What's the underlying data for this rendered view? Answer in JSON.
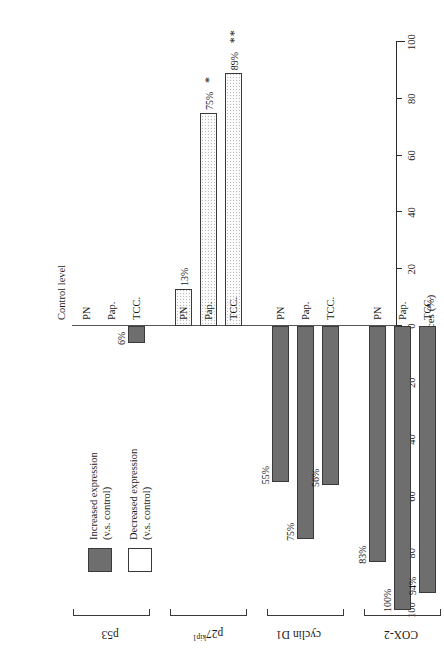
{
  "chart_data": {
    "type": "bar",
    "orientation": "horizontal-diverging",
    "title": "",
    "xlabel": "Incidences (%)",
    "ylabel": "",
    "axis_title": "Incidences (%)",
    "control_line_label": "Control level",
    "xlim": [
      -100,
      100
    ],
    "xticks": [
      -100,
      -80,
      -60,
      -40,
      -20,
      0,
      20,
      40,
      60,
      80,
      100
    ],
    "xticklabels": [
      "100",
      "80",
      "60",
      "40",
      "20",
      "0",
      "20",
      "40",
      "60",
      "80",
      "100"
    ],
    "grid": false,
    "legend_position": "upper-right",
    "legend": [
      {
        "key": "increased",
        "line1": "Increased expression",
        "line2": "(v.s. control)",
        "color": "#6e6e6e"
      },
      {
        "key": "decreased",
        "line1": "Decreased expression",
        "line2": "(v.s. control)",
        "color": "#ffffff"
      }
    ],
    "categories": [
      "PN",
      "Pap.",
      "TCC."
    ],
    "groups": [
      {
        "name": "p53",
        "name_sup": "",
        "bars": [
          {
            "category": "PN",
            "value": 0,
            "label": "",
            "direction": "increased",
            "significance": ""
          },
          {
            "category": "Pap.",
            "value": 0,
            "label": "",
            "direction": "increased",
            "significance": ""
          },
          {
            "category": "TCC.",
            "value": 6,
            "label": "6%",
            "direction": "increased",
            "significance": ""
          }
        ]
      },
      {
        "name": "p27",
        "name_sup": "kip1",
        "bars": [
          {
            "category": "PN",
            "value": 13,
            "label": "13%",
            "direction": "decreased",
            "significance": ""
          },
          {
            "category": "Pap.",
            "value": 75,
            "label": "75%",
            "direction": "decreased",
            "significance": "*"
          },
          {
            "category": "TCC.",
            "value": 89,
            "label": "89%",
            "direction": "decreased",
            "significance": "**"
          }
        ]
      },
      {
        "name": "cyclin D1",
        "name_sup": "",
        "bars": [
          {
            "category": "PN",
            "value": 55,
            "label": "55%",
            "direction": "increased",
            "significance": ""
          },
          {
            "category": "Pap.",
            "value": 75,
            "label": "75%",
            "direction": "increased",
            "significance": ""
          },
          {
            "category": "TCC.",
            "value": 56,
            "label": "56%",
            "direction": "increased",
            "significance": ""
          }
        ]
      },
      {
        "name": "COX-2",
        "name_sup": "",
        "bars": [
          {
            "category": "PN",
            "value": 83,
            "label": "83%",
            "direction": "increased",
            "significance": ""
          },
          {
            "category": "Pap.",
            "value": 100,
            "label": "100%",
            "direction": "increased",
            "significance": ""
          },
          {
            "category": "TCC.",
            "value": 94,
            "label": "94%",
            "direction": "increased",
            "significance": ""
          }
        ]
      }
    ]
  }
}
